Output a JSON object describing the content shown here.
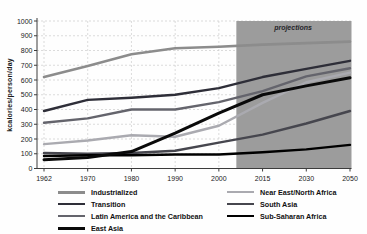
{
  "chart_data": {
    "type": "line",
    "title": "",
    "xlabel": "",
    "ylabel": "kcalories/person/day",
    "ylim": [
      0,
      1000
    ],
    "y_ticks": [
      0,
      100,
      200,
      300,
      400,
      500,
      600,
      700,
      800,
      900,
      1000
    ],
    "categories": [
      1962,
      1970,
      1980,
      1990,
      2000,
      2015,
      2030,
      2050
    ],
    "grid": "dashed",
    "legend_position": "bottom",
    "projection_region": {
      "label": "projections",
      "starts_after_year": 2006,
      "color": "#9c9c9c"
    },
    "colors": {
      "axis": "#3c3c3c",
      "gridline": "#cccccc",
      "tick_text": "#1a1a1a",
      "background": "#ffffff"
    },
    "series": [
      {
        "name": "Industrialized",
        "color": "#8c8c8c",
        "width": 2.6,
        "values": [
          620,
          695,
          775,
          815,
          825,
          840,
          850,
          860
        ]
      },
      {
        "name": "Transition",
        "color": "#2e2e38",
        "width": 2.4,
        "values": [
          390,
          465,
          480,
          500,
          545,
          620,
          675,
          730
        ]
      },
      {
        "name": "Latin America and the Caribbean",
        "color": "#64646c",
        "width": 2.4,
        "values": [
          310,
          340,
          400,
          400,
          450,
          525,
          625,
          680
        ]
      },
      {
        "name": "East Asia",
        "color": "#0a0a0a",
        "width": 3.0,
        "values": [
          60,
          75,
          115,
          240,
          375,
          500,
          560,
          615
        ]
      },
      {
        "name": "Near East/North Africa",
        "color": "#aaaab0",
        "width": 2.4,
        "values": [
          165,
          190,
          225,
          215,
          290,
          445,
          585,
          650
        ]
      },
      {
        "name": "South Asia",
        "color": "#46464e",
        "width": 2.4,
        "values": [
          105,
          100,
          105,
          120,
          175,
          230,
          305,
          390
        ]
      },
      {
        "name": "Sub-Saharan Africa",
        "color": "#000000",
        "width": 2.4,
        "values": [
          85,
          90,
          90,
          95,
          95,
          110,
          130,
          160
        ]
      }
    ],
    "legend_columns": [
      [
        0,
        1,
        2,
        3
      ],
      [
        4,
        5,
        6
      ]
    ]
  }
}
